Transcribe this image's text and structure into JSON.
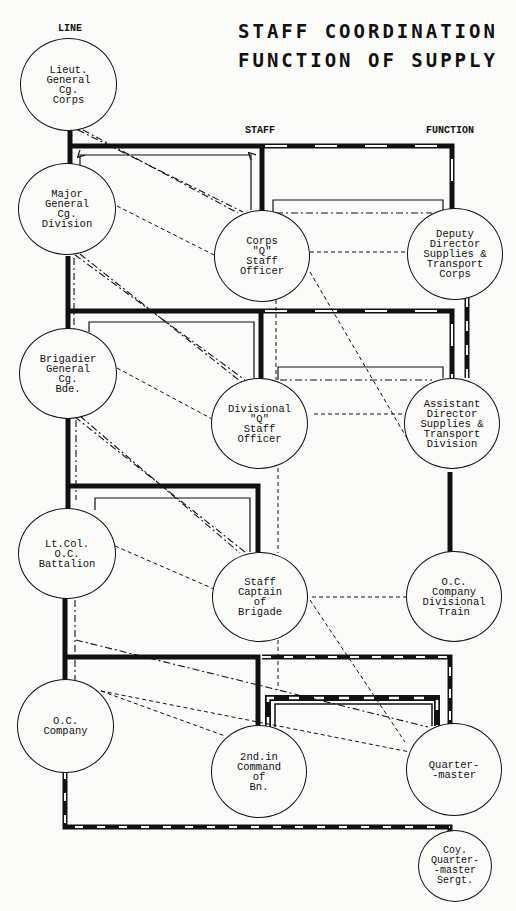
{
  "title": {
    "line1": "STAFF COORDINATION",
    "line2": "FUNCTION OF SUPPLY"
  },
  "columns": {
    "line": "LINE",
    "staff": "STAFF",
    "function": "FUNCTION"
  },
  "nodes": {
    "lieut_general": "Lieut.\nGeneral\nCg.\nCorps",
    "major_general": "Major\nGeneral\nCg.\nDivision",
    "brigadier_general": "Brigadier\nGeneral\nCg.\nBde.",
    "lt_col": "Lt.Col.\nO.C.\nBattalion",
    "oc_company": "O.C.\nCompany",
    "corps_q": "Corps\n\"Q\"\nStaff\nOfficer",
    "divisional_q": "Divisional\n\"Q\"\nStaff\nOfficer",
    "staff_captain": "Staff\nCaptain\nof\nBrigade",
    "second_in_command": "2nd.in\nCommand\nof\nBn.",
    "deputy_director": "Deputy\nDirector\nSupplies &\nTransport\nCorps",
    "assistant_director": "Assistant\nDirector\nSupplies &\nTransport\nDivision",
    "oc_company_div_train": "O.C.\nCompany\nDivisional\nTrain",
    "quartermaster": "Quarter-\n-master",
    "coy_qm_sergt": "Coy.\nQuarter-\n-master\nSergt."
  },
  "legend_styles": {
    "command_line": "thick solid",
    "supply_line": "thick black/white dashed",
    "staff_request": "thin solid with arrows",
    "coordination": "dash-dot",
    "information": "dashed"
  },
  "colors": {
    "ink": "#111111",
    "paper": "#fbfbfa"
  }
}
